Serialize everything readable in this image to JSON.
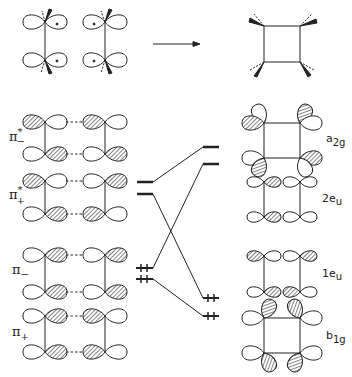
{
  "figure": {
    "reaction_arrow": "reactants-to-product",
    "colors": {
      "ink": "#222222",
      "hatch": "#444444",
      "background": "#ffffff"
    }
  },
  "left_labels": {
    "pi_minus_star": {
      "base": "π",
      "sup": "*",
      "sub": "−"
    },
    "pi_plus_star": {
      "base": "π",
      "sup": "*",
      "sub": "+"
    },
    "pi_minus": {
      "base": "π",
      "sup": "",
      "sub": "−"
    },
    "pi_plus": {
      "base": "π",
      "sup": "",
      "sub": "+"
    }
  },
  "right_labels": {
    "a2g": {
      "base": "a",
      "sub": "2g"
    },
    "2eu": {
      "base": "2e",
      "sub": "u"
    },
    "1eu": {
      "base": "1e",
      "sub": "u"
    },
    "b1g": {
      "base": "b",
      "sub": "1g"
    }
  },
  "correlation": {
    "left_levels": [
      {
        "name": "pi_minus_star",
        "occupancy": 0
      },
      {
        "name": "pi_plus_star",
        "occupancy": 0
      },
      {
        "name": "pi_minus",
        "occupancy": 2
      },
      {
        "name": "pi_plus",
        "occupancy": 2
      }
    ],
    "right_levels": [
      {
        "name": "a2g",
        "occupancy": 0
      },
      {
        "name": "2eu",
        "occupancy": 0
      },
      {
        "name": "1eu",
        "occupancy": 2
      },
      {
        "name": "b1g",
        "occupancy": 2
      }
    ],
    "connections": [
      [
        "pi_minus_star",
        "a2g"
      ],
      [
        "pi_plus_star",
        "1eu"
      ],
      [
        "pi_minus",
        "2eu"
      ],
      [
        "pi_plus",
        "b1g"
      ]
    ]
  }
}
